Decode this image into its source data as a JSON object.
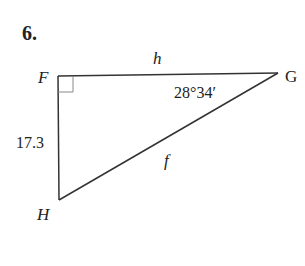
{
  "problem": {
    "number": "6."
  },
  "triangle": {
    "vertices": {
      "F": "F",
      "G": "G",
      "H": "H"
    },
    "sides": {
      "FG": "h",
      "FH": "17.3",
      "GH": "f"
    },
    "angles": {
      "G": "28°34′",
      "F": "right angle"
    },
    "colors": {
      "stroke": "#333333",
      "right_angle_marker": "#888888",
      "text": "#222222"
    }
  }
}
